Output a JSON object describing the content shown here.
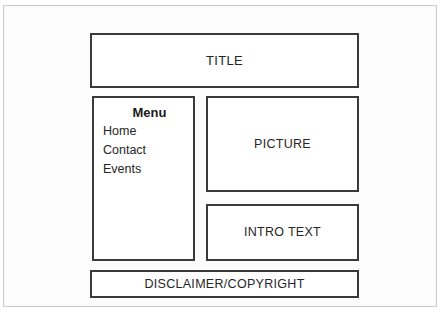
{
  "wireframe": {
    "title_block": {
      "label": "TITLE"
    },
    "menu_block": {
      "heading": "Menu",
      "items": [
        {
          "label": "Home"
        },
        {
          "label": "Contact"
        },
        {
          "label": "Events"
        }
      ]
    },
    "picture_block": {
      "label": "PICTURE"
    },
    "intro_block": {
      "label": "INTRO TEXT"
    },
    "disclaimer_block": {
      "label": "DISCLAIMER/COPYRIGHT"
    }
  },
  "colors": {
    "page_background": "#fcfcfc",
    "box_border": "#3a3a3a",
    "box_fill": "#ffffff",
    "text": "#262626",
    "frame_border": "#c9c9c9"
  }
}
